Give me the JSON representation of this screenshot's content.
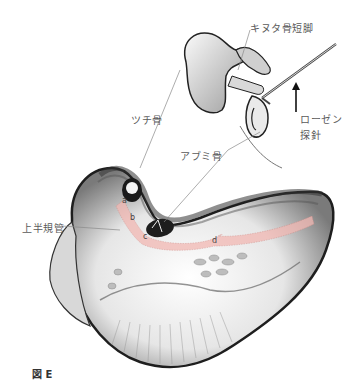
{
  "figure": {
    "caption": "図 E",
    "labels": {
      "incus_short_process": "キヌタ骨短脚",
      "rosen_probe_line1": "ローゼン",
      "rosen_probe_line2": "探針",
      "malleus": "ツチ骨",
      "stapes": "アブミ骨",
      "superior_semicircular_canal": "上半規管"
    },
    "canal_letters": [
      "a",
      "b",
      "c",
      "d"
    ],
    "colors": {
      "canal_highlight": "#f2b8b3",
      "line": "#888888",
      "bone_dark": "#222222"
    }
  }
}
